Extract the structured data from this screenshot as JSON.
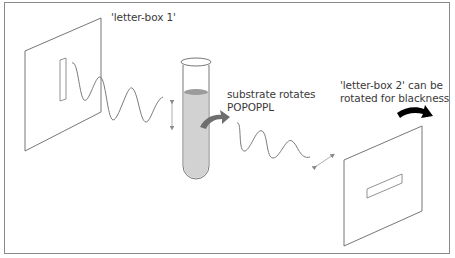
{
  "diagram": {
    "labels": {
      "letter_box_1": "'letter-box 1'",
      "substrate_line1": "substrate rotates",
      "substrate_line2": "POPOPPL",
      "letter_box_2_line1": "'letter-box 2' can be",
      "letter_box_2_line2": "rotated for blackness"
    },
    "components": [
      {
        "id": "letter-box-1",
        "type": "polarizer-panel",
        "slot": "vertical"
      },
      {
        "id": "light-wave-1",
        "type": "wave",
        "polarization": "vertical"
      },
      {
        "id": "vertical-polarization-arrow",
        "type": "double-arrow"
      },
      {
        "id": "test-tube",
        "type": "sample-tube",
        "contents": "substrate"
      },
      {
        "id": "rotation-arrow-grey",
        "type": "curved-arrow"
      },
      {
        "id": "light-wave-2",
        "type": "wave",
        "polarization": "rotated"
      },
      {
        "id": "rotated-polarization-arrow",
        "type": "double-arrow"
      },
      {
        "id": "letter-box-2",
        "type": "analyzer-panel",
        "slot": "horizontal-tilted"
      },
      {
        "id": "rotation-arrow-black",
        "type": "curved-arrow"
      }
    ],
    "colors": {
      "frame": "#8a8a8a",
      "line": "#555555",
      "wave": "#7a7a7a",
      "liquid": "#cfcfcf",
      "liquid_surface": "#9a9a9a",
      "grey_arrow": "#707070",
      "black_arrow": "#000000",
      "text": "#3a3a3a"
    }
  }
}
